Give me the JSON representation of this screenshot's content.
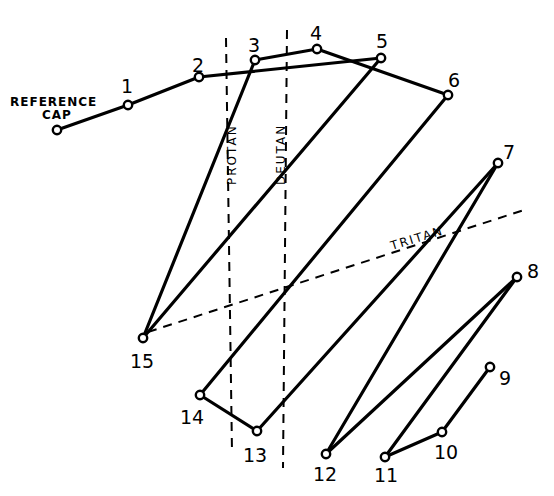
{
  "diagram": {
    "type": "cap-arrangement-test-plot",
    "reference_cap_label_line1": "REFERENCE",
    "reference_cap_label_line2": "CAP",
    "axes": [
      {
        "name": "PROTAN",
        "label": "PROTAN",
        "x1": 226,
        "y1": 38,
        "x2": 232,
        "y2": 452
      },
      {
        "name": "DEUTAN",
        "label": "DEUTAN",
        "x1": 287,
        "y1": 30,
        "x2": 283,
        "y2": 468
      },
      {
        "name": "TRITAN",
        "label": "TRITAN",
        "x1": 148,
        "y1": 332,
        "x2": 524,
        "y2": 210
      }
    ],
    "caps": [
      {
        "id": "ref",
        "label": "",
        "x": 57,
        "y": 130
      },
      {
        "id": "1",
        "label": "1",
        "x": 128,
        "y": 105
      },
      {
        "id": "2",
        "label": "2",
        "x": 199,
        "y": 77
      },
      {
        "id": "3",
        "label": "3",
        "x": 255,
        "y": 60
      },
      {
        "id": "4",
        "label": "4",
        "x": 317,
        "y": 49
      },
      {
        "id": "5",
        "label": "5",
        "x": 381,
        "y": 58
      },
      {
        "id": "6",
        "label": "6",
        "x": 448,
        "y": 95
      },
      {
        "id": "7",
        "label": "7",
        "x": 498,
        "y": 163
      },
      {
        "id": "8",
        "label": "8",
        "x": 517,
        "y": 277
      },
      {
        "id": "9",
        "label": "9",
        "x": 490,
        "y": 367
      },
      {
        "id": "10",
        "label": "10",
        "x": 442,
        "y": 432
      },
      {
        "id": "11",
        "label": "11",
        "x": 385,
        "y": 457
      },
      {
        "id": "12",
        "label": "12",
        "x": 326,
        "y": 454
      },
      {
        "id": "13",
        "label": "13",
        "x": 257,
        "y": 431
      },
      {
        "id": "14",
        "label": "14",
        "x": 200,
        "y": 395
      },
      {
        "id": "15",
        "label": "15",
        "x": 143,
        "y": 338
      }
    ],
    "sequence": [
      "ref",
      "1",
      "2",
      "5",
      "15",
      "3",
      "4",
      "6",
      "14",
      "13",
      "7",
      "12",
      "8",
      "11",
      "10",
      "9"
    ],
    "colors": {
      "line": "#000000",
      "background": "#ffffff"
    }
  }
}
